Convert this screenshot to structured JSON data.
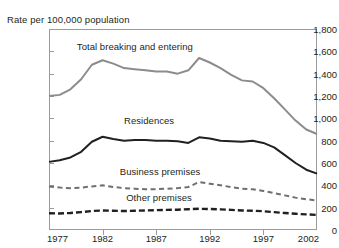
{
  "chart_data": {
    "type": "line",
    "title": "",
    "ylabel": "Rate per 100,000 population",
    "xlabel": "",
    "xlim": [
      1977,
      2002
    ],
    "ylim": [
      0,
      1800
    ],
    "grid": false,
    "legend_position": "inline-annotations",
    "y_ticks": [
      1800,
      1600,
      1400,
      1200,
      1000,
      800,
      600,
      400,
      200,
      0
    ],
    "y_tick_labels": [
      "1,800",
      "1,600",
      "1,400",
      "1,200",
      "1,000",
      "800",
      "600",
      "400",
      "200",
      "0"
    ],
    "x_ticks": [
      1977,
      1982,
      1987,
      1992,
      1997,
      2002
    ],
    "x_tick_labels": [
      "1977",
      "1982",
      "1987",
      "1992",
      "1997",
      "2002"
    ],
    "x": [
      1977,
      1978,
      1979,
      1980,
      1981,
      1982,
      1983,
      1984,
      1985,
      1986,
      1987,
      1988,
      1989,
      1990,
      1991,
      1992,
      1993,
      1994,
      1995,
      1996,
      1997,
      1998,
      1999,
      2000,
      2001,
      2002
    ],
    "series": [
      {
        "name": "Total breaking and entering",
        "color": "#8c8c8c",
        "style": "solid",
        "width": 2.0,
        "label_x": 1979.6,
        "label_y": 1640,
        "values": [
          1200,
          1210,
          1260,
          1350,
          1480,
          1520,
          1490,
          1450,
          1440,
          1430,
          1420,
          1420,
          1400,
          1430,
          1540,
          1500,
          1450,
          1390,
          1340,
          1330,
          1270,
          1180,
          1080,
          980,
          900,
          860
        ]
      },
      {
        "name": "Residences",
        "color": "#231f20",
        "style": "solid",
        "width": 2.0,
        "label_x": 1984.0,
        "label_y": 980,
        "values": [
          610,
          625,
          650,
          700,
          790,
          835,
          815,
          800,
          805,
          805,
          800,
          800,
          795,
          780,
          830,
          820,
          800,
          795,
          790,
          800,
          780,
          740,
          670,
          600,
          540,
          505
        ]
      },
      {
        "name": "Business premises",
        "color": "#6f6f6f",
        "style": "dashed",
        "width": 2.0,
        "label_x": 1983.6,
        "label_y": 520,
        "values": [
          390,
          380,
          375,
          380,
          390,
          400,
          385,
          375,
          370,
          365,
          365,
          370,
          375,
          385,
          430,
          415,
          400,
          385,
          370,
          365,
          350,
          330,
          310,
          290,
          275,
          265
        ]
      },
      {
        "name": "Other premises",
        "color": "#231f20",
        "style": "dashed-thick",
        "width": 2.4,
        "label_x": 1984.2,
        "label_y": 290,
        "values": [
          150,
          148,
          152,
          160,
          170,
          175,
          172,
          170,
          172,
          175,
          178,
          180,
          182,
          186,
          190,
          188,
          185,
          180,
          175,
          172,
          168,
          160,
          152,
          145,
          140,
          135
        ]
      }
    ]
  }
}
